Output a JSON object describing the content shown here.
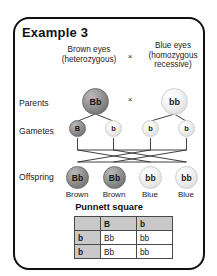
{
  "panel": {
    "title": "Example 3"
  },
  "parents_phenotypes": {
    "left": "Brown eyes\n(heterozygous)",
    "left_line1": "Brown eyes",
    "left_line2": "(heterozygous)",
    "right_line1": "Blue eyes",
    "right_line2": "(homozygous",
    "right_line3": "recessive)",
    "cross_symbol": "×"
  },
  "row_labels": {
    "parents": "Parents",
    "gametes": "Gametes",
    "offspring": "Offspring"
  },
  "parents": {
    "left_genotype": "Bb",
    "right_genotype": "bb",
    "cross_symbol": "×"
  },
  "gametes": [
    {
      "allele": "B",
      "shade": "dark"
    },
    {
      "allele": "b",
      "shade": "light"
    },
    {
      "allele": "b",
      "shade": "light"
    },
    {
      "allele": "b",
      "shade": "light"
    }
  ],
  "offspring": [
    {
      "genotype": "Bb",
      "phenotype": "Brown",
      "shade": "dark"
    },
    {
      "genotype": "Bb",
      "phenotype": "Brown",
      "shade": "dark"
    },
    {
      "genotype": "bb",
      "phenotype": "Blue",
      "shade": "light"
    },
    {
      "genotype": "bb",
      "phenotype": "Blue",
      "shade": "light"
    }
  ],
  "punnett": {
    "title": "Punnett square",
    "corner": "",
    "col_headers": [
      "B",
      "b"
    ],
    "row_headers": [
      "b",
      "b"
    ],
    "cells": [
      [
        "Bb",
        "bb"
      ],
      [
        "Bb",
        "bb"
      ]
    ]
  },
  "colors": {
    "frame": "#111111",
    "dark_allele": "#8a8a8a",
    "light_allele": "#e8e8e8",
    "table_header": "#c9c9c9",
    "line": "#2b2b2b"
  }
}
